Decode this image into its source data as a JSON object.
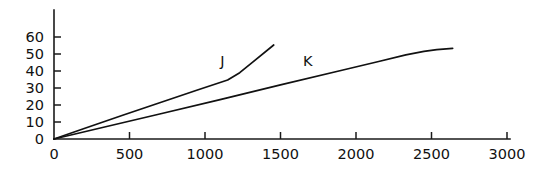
{
  "chart_data": {
    "type": "line",
    "title": "",
    "subtitle": "",
    "xlabel": "",
    "ylabel": "",
    "xlim": [
      0,
      3000
    ],
    "ylim": [
      0,
      65
    ],
    "xticks": [
      0,
      500,
      1000,
      1500,
      2000,
      2500,
      3000
    ],
    "xtick_labels": [
      "0",
      "500",
      "1000",
      "1500",
      "2000",
      "2500",
      "3000"
    ],
    "yticks": [
      0,
      10,
      20,
      30,
      40,
      50,
      60
    ],
    "ytick_labels": [
      "0",
      "10",
      "20",
      "30",
      "40",
      "50",
      "60"
    ],
    "grid": false,
    "legend": "inline-curve-labels",
    "axis_color": "#111111",
    "line_color": "#111111",
    "background": "#ffffff",
    "series": [
      {
        "name": "J",
        "label": "J",
        "label_x": 1115,
        "label_y": 46,
        "points": [
          [
            0,
            0
          ],
          [
            200,
            6.2
          ],
          [
            450,
            13.8
          ],
          [
            700,
            21.3
          ],
          [
            950,
            28.8
          ],
          [
            1150,
            34.7
          ],
          [
            1230,
            39.0
          ],
          [
            1320,
            45.5
          ],
          [
            1455,
            55.3
          ]
        ]
      },
      {
        "name": "K",
        "label": "K",
        "label_x": 1680,
        "label_y": 46,
        "points": [
          [
            0,
            0
          ],
          [
            300,
            6.3
          ],
          [
            700,
            14.7
          ],
          [
            1100,
            23.2
          ],
          [
            1500,
            31.8
          ],
          [
            1900,
            40.3
          ],
          [
            2150,
            45.6
          ],
          [
            2330,
            49.5
          ],
          [
            2450,
            51.5
          ],
          [
            2535,
            52.6
          ],
          [
            2640,
            53.3
          ]
        ]
      }
    ]
  },
  "axes": {
    "y_axis_name": "value-axis",
    "x_axis_name": "quantity-axis"
  }
}
